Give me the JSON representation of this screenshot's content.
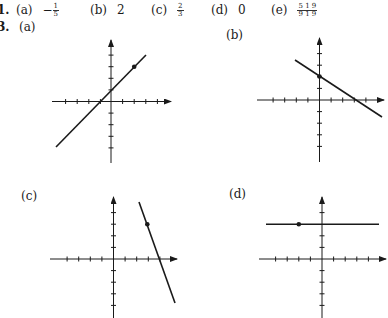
{
  "problem1": {
    "number": "1.",
    "answers": [
      {
        "label": "(a)",
        "value": "−",
        "frac": {
          "num": "1",
          "den": "5"
        }
      },
      {
        "label": "(b)",
        "value": "2"
      },
      {
        "label": "(c)",
        "value": "",
        "frac": {
          "num": "2",
          "den": "3"
        }
      },
      {
        "label": "(d)",
        "value": "0"
      },
      {
        "label": "(e)",
        "value": "",
        "frac": {
          "num": "5 1 9",
          "den": "9 1 9"
        }
      }
    ]
  },
  "problem3": {
    "number": "3.",
    "graphs": [
      {
        "label": "(a)",
        "description": "line through (-1,0) and (0,1), point at (2,3)",
        "slope": 1,
        "point": [
          2,
          3
        ]
      },
      {
        "label": "(b)",
        "description": "line through (0,2) and (3,0), point at (0,2)",
        "slope": -0.667,
        "point": [
          0,
          2
        ]
      },
      {
        "label": "(c)",
        "description": "steep line through (3,3) and (4,0), point at (3,3)",
        "slope": -3,
        "point": [
          3,
          3
        ]
      },
      {
        "label": "(d)",
        "description": "horizontal line y=3, point at (-2,3)",
        "slope": 0,
        "point": [
          -2,
          3
        ]
      }
    ]
  }
}
